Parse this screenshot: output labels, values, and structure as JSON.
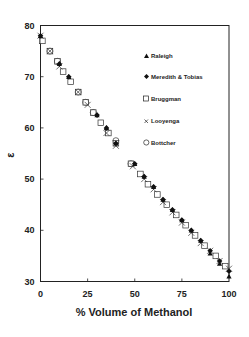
{
  "chart_data": {
    "type": "scatter",
    "title": "",
    "xlabel": "% Volume of Methanol",
    "ylabel": "ε",
    "xlim": [
      0,
      100
    ],
    "ylim": [
      30,
      80
    ],
    "xticks": [
      0,
      25,
      50,
      75,
      100
    ],
    "yticks": [
      30,
      40,
      50,
      60,
      70,
      80
    ],
    "grid": false,
    "legend_position": "upper right (inside)",
    "series": [
      {
        "name": "Raleigh",
        "marker": "filled-triangle",
        "x": [
          0,
          10,
          15,
          30,
          35,
          40,
          50,
          55,
          60,
          65,
          70,
          75,
          80,
          85,
          90,
          95,
          100
        ],
        "y": [
          78,
          72.5,
          70,
          62.5,
          60,
          57,
          53,
          50.5,
          48.5,
          46,
          44,
          42,
          40,
          38,
          35.5,
          33.5,
          31
        ]
      },
      {
        "name": "Meredith & Tobias",
        "marker": "filled-diamond",
        "x": [
          0,
          10,
          15,
          30,
          35,
          40,
          50,
          55,
          60,
          65,
          70,
          75,
          80,
          85,
          90,
          95,
          100
        ],
        "y": [
          78,
          72.5,
          70,
          62.5,
          60,
          57,
          53,
          50.5,
          48.5,
          46,
          44,
          42,
          40,
          38,
          36,
          34,
          32
        ]
      },
      {
        "name": "Bruggman",
        "marker": "open-square",
        "x": [
          1,
          5,
          9,
          12,
          16,
          20,
          24,
          28,
          32,
          36,
          40,
          48,
          53,
          57,
          62,
          67,
          72,
          77,
          82,
          87,
          93,
          98
        ],
        "y": [
          77,
          75,
          73,
          71,
          69,
          67,
          65,
          63,
          61,
          59,
          57,
          53,
          51,
          49,
          47,
          45,
          43,
          41,
          39,
          37,
          35,
          33
        ]
      },
      {
        "name": "Looyenga",
        "marker": "x-cross",
        "x": [
          0,
          5,
          10,
          20,
          25,
          35,
          40,
          49,
          55,
          60,
          65,
          70,
          75,
          80,
          85,
          90,
          95,
          100
        ],
        "y": [
          78,
          75,
          72,
          67,
          64.5,
          59,
          56.5,
          52.5,
          50,
          48,
          45.5,
          43.5,
          41.5,
          39.5,
          37.5,
          36,
          34,
          32.5
        ]
      },
      {
        "name": "Bottcher",
        "marker": "open-circle",
        "x": [
          5,
          9,
          20,
          24,
          28,
          40,
          48
        ],
        "y": [
          75,
          73,
          67,
          65,
          63,
          57.5,
          53
        ]
      }
    ]
  },
  "legend": {
    "items": [
      {
        "label": "Raleigh",
        "symbol": "▲"
      },
      {
        "label": "Meredith & Tobias",
        "symbol": "◆"
      },
      {
        "label": "Bruggman",
        "symbol": "□"
      },
      {
        "label": "Looyenga",
        "symbol": "×"
      },
      {
        "label": "Bottcher",
        "symbol": "○"
      }
    ]
  },
  "axes": {
    "x_title": "% Volume of Methanol",
    "y_title": "ε",
    "x_tick_labels": [
      "0",
      "25",
      "50",
      "75",
      "100"
    ],
    "y_tick_labels": [
      "30",
      "40",
      "50",
      "60",
      "70",
      "80"
    ]
  }
}
